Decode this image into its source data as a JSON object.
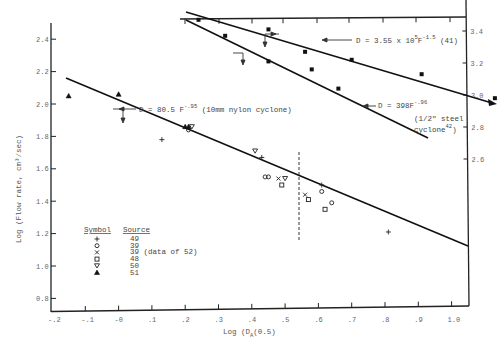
{
  "chart_data": {
    "type": "scatter",
    "title": "",
    "xlabel": "Log (D_A(0.5)",
    "ylabel": "Log (Flow rate, cm3/sec)",
    "y2label": "",
    "xlim": [
      -0.2,
      1.05
    ],
    "ylim": [
      0.7,
      2.5
    ],
    "y2lim": [
      2.3,
      3.5
    ],
    "grid": false,
    "x_ticks": [
      "-.2",
      "-.1",
      "-0",
      ".1",
      ".2",
      ".3",
      ".4",
      ".5",
      ".6",
      ".7",
      ".8",
      ".9",
      "1.0"
    ],
    "y_ticks": [
      "2.4",
      "2.2",
      "2.0",
      "1.8",
      "1.6",
      "1.4",
      "1.2",
      "1.0",
      "0.8"
    ],
    "y2_ticks": [
      "3.4",
      "3.2",
      "3.0",
      "2.8",
      "2.6"
    ],
    "lines": [
      {
        "name": "D = 80.5 F^-.95 (10mm nylon cyclone)",
        "x": [
          -0.16,
          1.05
        ],
        "y": [
          2.16,
          0.94
        ]
      },
      {
        "name": "D = 3.55 x 10^5 F^-1.5 (41)",
        "axis": "right",
        "x": [
          0.2,
          1.13
        ],
        "y": [
          3.5,
          2.98
        ]
      },
      {
        "name": "D = 398F^-.96 (1/2\" steel cyclone 42)",
        "axis": "right",
        "x": [
          0.2,
          0.93
        ],
        "y": [
          3.47,
          2.75
        ]
      }
    ],
    "series": [
      {
        "name": "49",
        "symbol": "+",
        "points": [
          [
            0.13,
            1.78
          ],
          [
            0.43,
            1.67
          ],
          [
            0.61,
            1.5
          ],
          [
            0.81,
            1.21
          ]
        ]
      },
      {
        "name": "39",
        "symbol": "o",
        "points": [
          [
            0.21,
            1.84
          ],
          [
            0.44,
            1.55
          ],
          [
            0.45,
            1.55
          ],
          [
            0.61,
            1.46
          ],
          [
            0.64,
            1.39
          ]
        ]
      },
      {
        "name": "39 (data of 52)",
        "symbol": "x",
        "points": [
          [
            0.48,
            1.54
          ],
          [
            0.56,
            1.44
          ]
        ]
      },
      {
        "name": "48",
        "symbol": "square",
        "points": [
          [
            0.49,
            1.5
          ],
          [
            0.57,
            1.41
          ],
          [
            0.62,
            1.35
          ]
        ]
      },
      {
        "name": "50",
        "symbol": "triangle-down",
        "points": [
          [
            0.41,
            1.71
          ],
          [
            0.5,
            1.54
          ],
          [
            0.22,
            1.86
          ]
        ]
      },
      {
        "name": "51",
        "symbol": "triangle-up",
        "points": [
          [
            -0.15,
            2.05
          ],
          [
            0.0,
            2.06
          ],
          [
            0.2,
            1.86
          ],
          [
            0.21,
            1.86
          ]
        ]
      }
    ],
    "right_axis_points": [
      [
        0.24,
        3.47
      ],
      [
        0.45,
        3.41
      ],
      [
        0.45,
        3.21
      ],
      [
        0.7,
        3.22
      ],
      [
        0.91,
        3.13
      ],
      [
        1.13,
        2.98
      ],
      [
        0.32,
        3.37
      ],
      [
        0.56,
        3.27
      ],
      [
        0.66,
        3.04
      ],
      [
        0.58,
        3.16
      ]
    ],
    "legend": {
      "position": "lower-left",
      "header_symbol": "Symbol",
      "header_source": "Source",
      "entries": [
        {
          "symbol": "+",
          "source": "49"
        },
        {
          "symbol": "o",
          "source": "39"
        },
        {
          "symbol": "x",
          "source": "39 (data of 52)"
        },
        {
          "symbol": "square",
          "source": "48"
        },
        {
          "symbol": "triangle-down",
          "source": "50"
        },
        {
          "symbol": "triangle-up",
          "source": "51"
        }
      ]
    },
    "annotations": [
      "D = 80.5 F^-.95 (10mm nylon cyclone)",
      "D = 3.55 x 10^5 F^-1.5 (41)",
      "D = 398F^-.96",
      "(1/2\" steel",
      "cyclone42)"
    ],
    "reference_line": {
      "type": "vertical-dashed",
      "x": 0.55,
      "y_range": [
        1.15,
        1.7
      ]
    }
  },
  "labels": {
    "xlabel_pre": "Log ",
    "xlabel_paren": "(D",
    "xlabel_sub": "A",
    "xlabel_post": "(0.5)",
    "ylabel": "Log (Flow rate, cm³/sec)",
    "ann_main_pre": "D = 80.5 F",
    "ann_main_exp": "-.95",
    "ann_main_post": " (10mm nylon cyclone)",
    "ann_41_pre": "D = 3.55 x 10",
    "ann_41_exp1": "5",
    "ann_41_mid": "F",
    "ann_41_exp2": "-1.5",
    "ann_41_post": "  (41)",
    "ann_42_pre": "D = 398F",
    "ann_42_exp": "-.96",
    "ann_42_line2": "(1/2\" steel",
    "ann_42_line3": "cyclone",
    "ann_42_sup": "42",
    "ann_42_close": ")"
  }
}
